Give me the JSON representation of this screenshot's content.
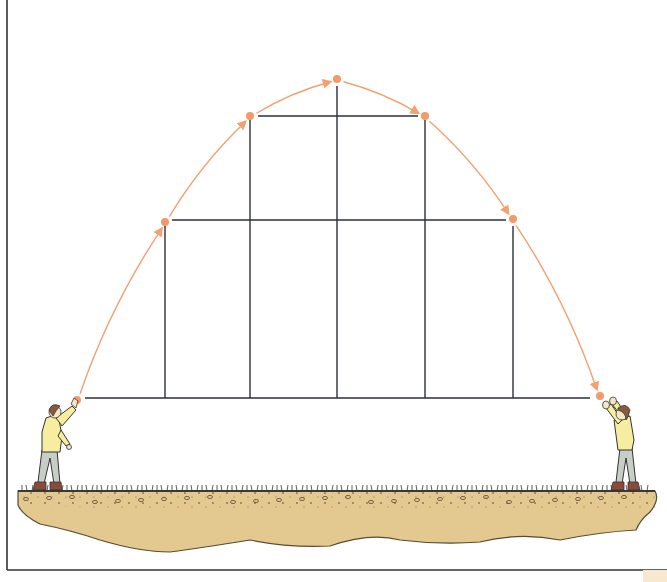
{
  "diagram": {
    "colors": {
      "trajectory": "#f4a070",
      "point": "#f39a6b",
      "grid_line": "#2b2f36",
      "frame": "#333333",
      "soil": "#e3c98f",
      "soil_outline": "#5a4a30",
      "shirt": "#f7eda0",
      "pants": "#c9cdc7",
      "hair": "#8a5a3c"
    },
    "points": [
      {
        "id": "p0",
        "x": 77,
        "y": 400
      },
      {
        "id": "p1",
        "x": 165,
        "y": 222
      },
      {
        "id": "p2",
        "x": 250,
        "y": 116
      },
      {
        "id": "p3",
        "x": 337,
        "y": 79
      },
      {
        "id": "p4",
        "x": 425,
        "y": 116
      },
      {
        "id": "p5",
        "x": 513,
        "y": 219
      },
      {
        "id": "p6",
        "x": 600,
        "y": 396
      }
    ],
    "vertical_lines": [
      {
        "x": 165,
        "y1": 224,
        "y2": 398
      },
      {
        "x": 250,
        "y1": 118,
        "y2": 398
      },
      {
        "x": 337,
        "y1": 86,
        "y2": 398
      },
      {
        "x": 425,
        "y1": 120,
        "y2": 398
      },
      {
        "x": 513,
        "y1": 226,
        "y2": 398
      }
    ],
    "horizontal_lines": [
      {
        "y": 398,
        "x1": 85,
        "x2": 590
      },
      {
        "y": 116,
        "x1": 258,
        "x2": 418
      },
      {
        "y": 220,
        "x1": 172,
        "x2": 506
      }
    ],
    "people": [
      {
        "id": "thrower",
        "side": "left"
      },
      {
        "id": "catcher",
        "side": "right"
      }
    ]
  }
}
